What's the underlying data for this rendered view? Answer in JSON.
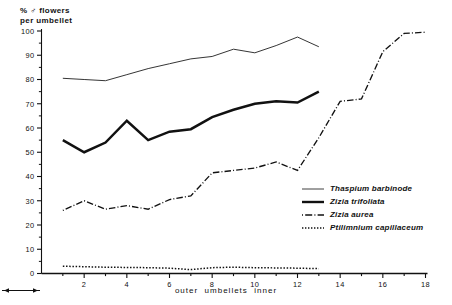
{
  "chart_data": {
    "type": "line",
    "title": "",
    "ylabel_line1": "% ♂ flowers",
    "ylabel_line2": "per umbellet",
    "xlabel": "outer ← umbellets → inner",
    "xlabel_left": "outer",
    "xlabel_mid": "umbellets",
    "xlabel_right": "inner",
    "xlim": [
      0,
      18
    ],
    "ylim": [
      0,
      100
    ],
    "xticks": [
      2,
      4,
      6,
      8,
      10,
      12,
      14,
      16,
      18
    ],
    "xtick_labels": [
      "2",
      "4",
      "6",
      "8",
      "10",
      "12",
      "14",
      "16",
      "18"
    ],
    "yticks": [
      0,
      10,
      20,
      30,
      40,
      50,
      60,
      70,
      80,
      90,
      100
    ],
    "ytick_labels": [
      "0",
      "10",
      "20",
      "30",
      "40",
      "50",
      "60",
      "70",
      "80",
      "90",
      "100"
    ],
    "yminorticks": [
      5,
      15,
      25,
      35,
      45,
      55,
      65,
      75,
      85,
      95
    ],
    "grid": false,
    "legend_position": "right-lower",
    "series": [
      {
        "name": "Thaspium barbinode",
        "style": "solid-thin",
        "color": "#2a2a2a",
        "x": [
          1,
          2,
          3,
          4,
          5,
          6,
          7,
          8,
          9,
          10,
          11,
          12,
          13
        ],
        "values": [
          80.5,
          80.0,
          79.5,
          82.0,
          84.5,
          86.5,
          88.5,
          89.5,
          92.5,
          91.0,
          94.0,
          97.5,
          93.5
        ]
      },
      {
        "name": "Zizia trifoliata",
        "style": "solid-thick",
        "color": "#111111",
        "x": [
          1,
          2,
          3,
          4,
          5,
          6,
          7,
          8,
          9,
          10,
          11,
          12,
          13
        ],
        "values": [
          55.0,
          50.0,
          54.0,
          63.0,
          55.0,
          58.5,
          59.5,
          64.5,
          67.5,
          70.0,
          71.0,
          70.5,
          75.0
        ]
      },
      {
        "name": "Zizia aurea",
        "style": "dash-dot",
        "color": "#111111",
        "x": [
          1,
          2,
          3,
          4,
          5,
          6,
          7,
          8,
          9,
          10,
          11,
          12,
          13,
          14,
          15,
          16,
          17,
          18
        ],
        "values": [
          26.0,
          30.0,
          26.5,
          28.0,
          26.5,
          30.5,
          32.0,
          41.5,
          42.5,
          43.5,
          46.0,
          42.5,
          56.0,
          71.0,
          72.0,
          91.5,
          99.0,
          99.5
        ]
      },
      {
        "name": "Ptilimnium capillaceum",
        "style": "dotted",
        "color": "#111111",
        "x": [
          1,
          2,
          3,
          4,
          5,
          6,
          7,
          8,
          9,
          10,
          11,
          12,
          13
        ],
        "values": [
          3.0,
          2.8,
          2.6,
          2.5,
          2.4,
          2.2,
          1.6,
          2.4,
          2.6,
          2.4,
          2.3,
          2.2,
          2.0
        ]
      }
    ]
  },
  "legend": {
    "items": [
      {
        "label": "Thaspium barbinode",
        "key": "solid-thin-key"
      },
      {
        "label": "Zizia trifoliata",
        "key": "solid-thick-key"
      },
      {
        "label": "Zizia aurea",
        "key": "dash-dot-key"
      },
      {
        "label": "Ptilimnium capillaceum",
        "key": "dotted-key"
      }
    ]
  }
}
